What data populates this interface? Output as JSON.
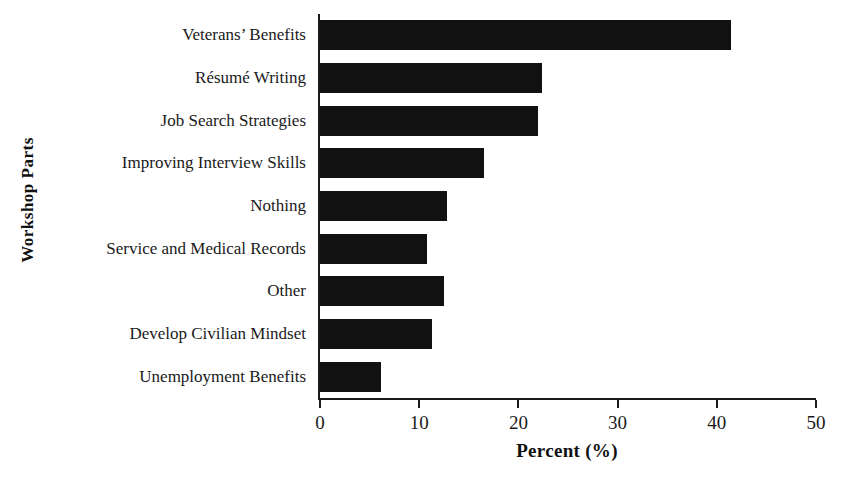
{
  "chart_data": {
    "type": "bar",
    "orientation": "horizontal",
    "title": "",
    "xlabel": "Percent (%)",
    "ylabel": "Workshop Parts",
    "xlim": [
      0,
      50
    ],
    "xticks": [
      0,
      10,
      20,
      30,
      40,
      50
    ],
    "xtick_labels": [
      "0",
      "10",
      "20",
      "30",
      "40",
      "50"
    ],
    "grid": false,
    "legend": false,
    "bar_color": "#111111",
    "axis_color": "#1a1a1a",
    "background": "#ffffff",
    "categories": [
      "Veterans’ Benefits",
      "Résumé Writing",
      "Job Search Strategies",
      "Improving Interview Skills",
      "Nothing",
      "Service and Medical Records",
      "Other",
      "Develop Civilian Mindset",
      "Unemployment Benefits"
    ],
    "values": [
      41.4,
      22.4,
      22.0,
      16.5,
      12.8,
      10.8,
      12.5,
      11.3,
      6.1
    ]
  }
}
